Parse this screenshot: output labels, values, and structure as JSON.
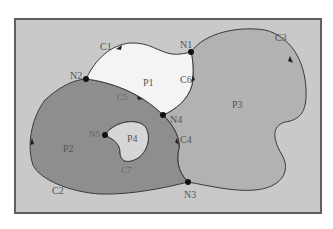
{
  "diagram": {
    "type": "topology-polygons",
    "frame": {
      "fill": "#c9c9c9",
      "stroke": "#5f5f5f"
    },
    "colors": {
      "P1": "#f4f4f4",
      "P2": "#8e8e8e",
      "P3": "#b2b2b2",
      "P4": "#d6d6d6",
      "edge": "#3a3a3a",
      "node": "#111111",
      "label": "#555555"
    },
    "polygons": [
      {
        "id": "P1",
        "label": "P1"
      },
      {
        "id": "P2",
        "label": "P2"
      },
      {
        "id": "P3",
        "label": "P3"
      },
      {
        "id": "P4",
        "label": "P4"
      }
    ],
    "nodes": [
      {
        "id": "N1",
        "label": "N1"
      },
      {
        "id": "N2",
        "label": "N2"
      },
      {
        "id": "N3",
        "label": "N3"
      },
      {
        "id": "N4",
        "label": "N4"
      },
      {
        "id": "N5",
        "label": "N5"
      }
    ],
    "chains": [
      {
        "id": "C1",
        "label": "C1"
      },
      {
        "id": "C2",
        "label": "C2"
      },
      {
        "id": "C3",
        "label": "C3"
      },
      {
        "id": "C4",
        "label": "C4"
      },
      {
        "id": "C5",
        "label": "C5"
      },
      {
        "id": "C6",
        "label": "C6"
      },
      {
        "id": "C7",
        "label": "C7"
      }
    ]
  }
}
